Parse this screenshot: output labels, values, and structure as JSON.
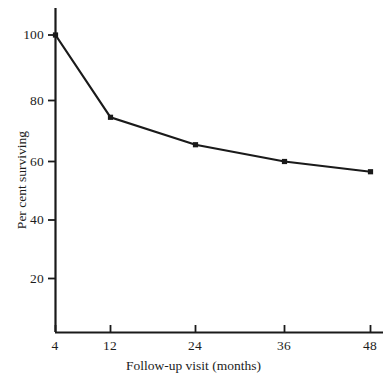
{
  "chart_data": {
    "type": "line",
    "title": "",
    "xlabel": "Follow-up visit (months)",
    "ylabel": "Per cent surviving",
    "x": [
      4,
      12,
      24,
      36,
      48
    ],
    "values": [
      100,
      74.5,
      65.5,
      60,
      56.5
    ],
    "series": [
      {
        "name": "Per cent surviving",
        "values": [
          100,
          74.5,
          65.5,
          60,
          56.5
        ]
      }
    ],
    "xticks": [
      "4",
      "12",
      "24",
      "36",
      "48"
    ],
    "xtick_values": [
      4,
      12,
      24,
      36,
      48
    ],
    "yticks": [
      "20",
      "40",
      "60",
      "80",
      "100"
    ],
    "ytick_values": [
      20,
      40,
      60,
      80,
      100
    ],
    "xlim": [
      4,
      48
    ],
    "ylim": [
      0,
      105
    ],
    "grid": false,
    "legend": false,
    "legend_position": "none",
    "marker": "filled-square",
    "line_color": "#1a1a1a",
    "marker_color": "#1a1a1a",
    "background_color": "#ffffff",
    "axis_color": "#1a1a1a"
  },
  "axes": {
    "y_title": "Per cent surviving",
    "x_title": "Follow-up visit (months)",
    "y_tick_labels": [
      {
        "text": "100",
        "value": 100
      },
      {
        "text": "80",
        "value": 80
      },
      {
        "text": "60",
        "value": 60
      },
      {
        "text": "40",
        "value": 40
      },
      {
        "text": "20",
        "value": 20
      }
    ],
    "x_tick_labels": [
      {
        "text": "4",
        "value": 4
      },
      {
        "text": "12",
        "value": 12
      },
      {
        "text": "24",
        "value": 24
      },
      {
        "text": "36",
        "value": 36
      },
      {
        "text": "48",
        "value": 48
      }
    ]
  }
}
